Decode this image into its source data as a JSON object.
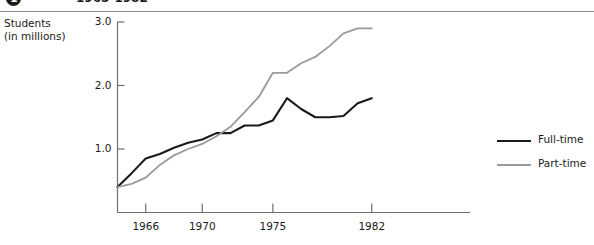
{
  "figure": {
    "number": "1",
    "caption": "",
    "years_text": "1965-1982",
    "axis_title_line1": "Students",
    "axis_title_line2": "(in millions)"
  },
  "legend": {
    "position": "right",
    "items": [
      {
        "label": "Full-time",
        "color": "#1a1a1a"
      },
      {
        "label": "Part-time",
        "color": "#9a9a9a"
      }
    ]
  },
  "chart_data": {
    "type": "line",
    "title": "1965-1982",
    "xlabel": "",
    "ylabel": "Students (in millions)",
    "xlim": [
      1964,
      1982
    ],
    "ylim": [
      0,
      3.0
    ],
    "grid": false,
    "legend_position": "right",
    "xticks": [
      1966,
      1970,
      1975,
      1982
    ],
    "xtick_labels": [
      "1966",
      "1970",
      "1975",
      "1982"
    ],
    "yticks": [
      1.0,
      2.0,
      3.0
    ],
    "ytick_labels": [
      "1.0",
      "2.0",
      "3.0"
    ],
    "x": [
      1964,
      1965,
      1966,
      1967,
      1968,
      1969,
      1970,
      1971,
      1972,
      1973,
      1974,
      1975,
      1976,
      1977,
      1978,
      1979,
      1980,
      1981,
      1982
    ],
    "series": [
      {
        "name": "Full-time",
        "color": "#1a1a1a",
        "values": [
          0.4,
          0.62,
          0.85,
          0.92,
          1.02,
          1.1,
          1.15,
          1.25,
          1.25,
          1.37,
          1.37,
          1.45,
          1.8,
          1.63,
          1.5,
          1.5,
          1.52,
          1.72,
          1.8
        ]
      },
      {
        "name": "Part-time",
        "color": "#9a9a9a",
        "values": [
          0.4,
          0.45,
          0.55,
          0.75,
          0.9,
          1.0,
          1.08,
          1.2,
          1.35,
          1.58,
          1.82,
          2.2,
          2.2,
          2.35,
          2.45,
          2.62,
          2.82,
          2.9,
          2.9
        ]
      }
    ]
  }
}
